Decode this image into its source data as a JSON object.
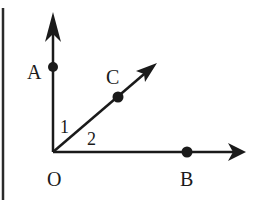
{
  "diagram": {
    "type": "angle-rays",
    "colors": {
      "ink": "#1a1a1a",
      "background": "#ffffff"
    },
    "points": {
      "O": {
        "label": "O"
      },
      "A": {
        "label": "A"
      },
      "B": {
        "label": "B"
      },
      "C": {
        "label": "C"
      }
    },
    "angles": [
      {
        "label": "1",
        "between": [
          "OA",
          "OC"
        ]
      },
      {
        "label": "2",
        "between": [
          "OC",
          "OB"
        ]
      }
    ],
    "rays": [
      "OA",
      "OC",
      "OB"
    ]
  }
}
